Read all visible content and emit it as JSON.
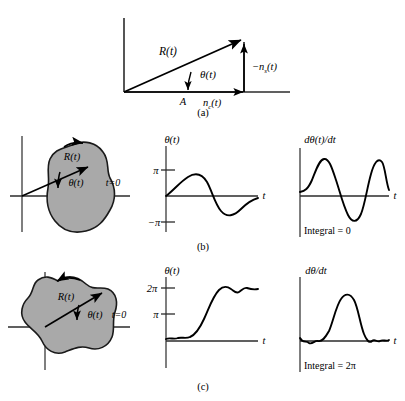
{
  "figure": {
    "panels": [
      {
        "id": "a",
        "caption": "(a)",
        "type": "phasor-diagram",
        "labels": {
          "resultant": "R(t)",
          "angle": "θ(t)",
          "amplitude": "A",
          "inphase_noise": "nₙ(t)",
          "inphase_noise_display": "n",
          "inphase_noise_sub": "c",
          "inphase_noise_tail": "(t)",
          "quadrature_noise_sign": "−n",
          "quadrature_noise_sub": "s",
          "quadrature_noise_tail": "(t)"
        }
      },
      {
        "id": "b",
        "caption": "(b)",
        "locus": {
          "label_R": "R(t)",
          "label_theta": "θ(t)",
          "label_t0": "t=0",
          "encircles_origin": false
        },
        "theta_plot": {
          "ylabel": "θ(t)",
          "xlabel": "t",
          "yticks": [
            "π",
            "−π"
          ],
          "ytick_values": [
            3.14159,
            -3.14159
          ]
        },
        "deriv_plot": {
          "ylabel": "dθ(t)/dt",
          "xlabel": "t",
          "annotation": "Integral = 0"
        }
      },
      {
        "id": "c",
        "caption": "(c)",
        "locus": {
          "label_R": "R(t)",
          "label_theta": "θ(t)",
          "label_t0": "t=0",
          "encircles_origin": true
        },
        "theta_plot": {
          "ylabel": "θ(t)",
          "xlabel": "t",
          "yticks": [
            "2π",
            "π"
          ],
          "ytick_values": [
            6.28319,
            3.14159
          ]
        },
        "deriv_plot": {
          "ylabel": "dθ/dt",
          "xlabel": "t",
          "annotation": "Integral = 2π"
        }
      }
    ],
    "colors": {
      "ink": "#000000",
      "blob_fill": "#a9a9a9",
      "blob_stroke": "#1a1a1a",
      "axis": "#2b2b2b",
      "background": "#ffffff"
    }
  }
}
